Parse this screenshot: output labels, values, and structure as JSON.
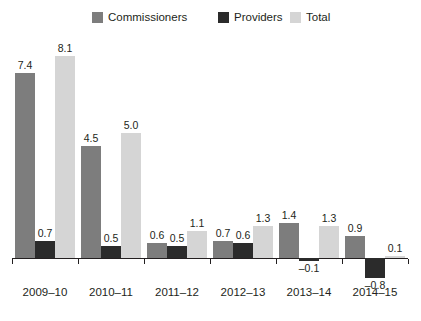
{
  "legend": {
    "items": [
      {
        "label": "Commissioners",
        "color": "#7d7d7d",
        "x": 92
      },
      {
        "label": "Providers",
        "color": "#2b2b2b",
        "x": 218
      },
      {
        "label": "Total",
        "color": "#d5d5d5",
        "x": 290
      }
    ]
  },
  "chart_data": {
    "type": "bar",
    "title": "",
    "subtitle": "",
    "xlabel": "",
    "ylabel": "",
    "grid": false,
    "legend_position": "top",
    "ylim": [
      -1.0,
      8.5
    ],
    "categories": [
      "2009–10",
      "2010–11",
      "2011–12",
      "2012–13",
      "2013–14",
      "2014–15"
    ],
    "series": [
      {
        "name": "Commissioners",
        "color": "#7d7d7d",
        "values": [
          7.4,
          4.5,
          0.6,
          0.7,
          1.4,
          0.9
        ],
        "labels": [
          "7.4",
          "4.5",
          "0.6",
          "0.7",
          "1.4",
          "0.9"
        ]
      },
      {
        "name": "Providers",
        "color": "#2b2b2b",
        "values": [
          0.7,
          0.5,
          0.5,
          0.6,
          -0.1,
          -0.8
        ],
        "labels": [
          "0.7",
          "0.5",
          "0.5",
          "0.6",
          "–0.1",
          "–0.8"
        ]
      },
      {
        "name": "Total",
        "color": "#d5d5d5",
        "values": [
          8.1,
          5.0,
          1.1,
          1.3,
          1.3,
          0.1
        ],
        "labels": [
          "8.1",
          "5.0",
          "1.1",
          "1.3",
          "1.3",
          "0.1"
        ]
      }
    ]
  },
  "axis": {
    "baseline_y": 258,
    "left": 12,
    "right": 408,
    "unit_px": 25.0,
    "group_width": 66,
    "group_start": 12,
    "bar_width": 20
  }
}
